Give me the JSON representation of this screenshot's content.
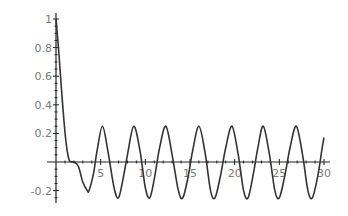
{
  "chart_data": {
    "type": "line",
    "title": "",
    "xlabel": "",
    "ylabel": "",
    "xlim": [
      0,
      30
    ],
    "ylim": [
      -0.25,
      1
    ],
    "grid": false,
    "legend": null,
    "x_ticks": [
      5,
      10,
      15,
      20,
      25,
      30
    ],
    "x_tick_labels": [
      "5",
      "10",
      "15",
      "20",
      "25",
      "30"
    ],
    "y_ticks": [
      -0.2,
      0.2,
      0.4,
      0.6,
      0.8,
      1
    ],
    "y_tick_labels": [
      "-0.2",
      "0.2",
      "0.4",
      "0.6",
      "0.8",
      "1"
    ],
    "series": [
      {
        "name": "f(x)",
        "description": "Starts at 1 at x=0, drops steeply to ~0 by x≈1.5, stays near 0 until x≈2.5, then oscillates with amplitude ≈0.25 and period ≈3.6",
        "x": [
          0,
          0.3,
          0.6,
          0.9,
          1.2,
          1.5,
          2.0,
          2.5,
          3.0,
          3.5,
          3.7,
          4.2,
          4.6,
          5.2,
          5.8,
          6.5,
          7.0,
          7.5,
          8.0,
          8.7,
          9.4,
          10.0,
          10.5,
          11.0,
          11.6,
          12.3,
          13.0,
          13.7,
          14.2,
          14.8,
          15.3,
          16.0,
          16.7,
          17.3,
          17.8,
          18.4,
          19.0,
          19.7,
          20.4,
          21.0,
          21.5,
          22.1,
          22.6,
          23.2,
          23.9,
          24.5,
          25.0,
          25.6,
          26.2,
          26.9,
          27.6,
          28.2,
          28.7,
          29.3,
          29.8,
          30.0
        ],
        "y": [
          1.0,
          0.78,
          0.52,
          0.28,
          0.1,
          0.01,
          0.0,
          -0.03,
          -0.14,
          -0.2,
          -0.2,
          -0.08,
          0.08,
          0.25,
          0.08,
          -0.18,
          -0.25,
          -0.12,
          0.05,
          0.25,
          0.08,
          -0.18,
          -0.25,
          -0.12,
          0.1,
          0.25,
          0.05,
          -0.2,
          -0.25,
          -0.1,
          0.08,
          0.25,
          0.06,
          -0.2,
          -0.25,
          -0.1,
          0.1,
          0.25,
          0.05,
          -0.2,
          -0.25,
          -0.08,
          0.1,
          0.25,
          0.05,
          -0.2,
          -0.25,
          -0.1,
          0.1,
          0.25,
          0.05,
          -0.2,
          -0.25,
          -0.1,
          0.1,
          0.17
        ]
      }
    ]
  },
  "plot_area": {
    "x0_px": 56,
    "x30_px": 324,
    "y0_px": 162,
    "y1_px": 19,
    "line_color": "#333333",
    "axis_color": "#222222",
    "label_color": "#7a7a7a"
  }
}
